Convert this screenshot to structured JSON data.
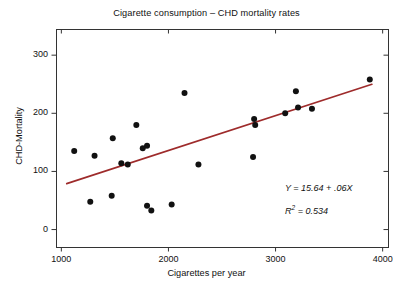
{
  "chart_data": {
    "type": "scatter",
    "title": "Cigarette consumption – CHD mortality rates",
    "xlabel": "Cigarettes per year",
    "ylabel": "CHD-Mortality",
    "xlim": [
      950,
      4050
    ],
    "ylim": [
      -30,
      345
    ],
    "xticks": [
      1000,
      2000,
      3000,
      4000
    ],
    "xtick_labels": [
      "1000",
      "2000",
      "3000",
      "4000"
    ],
    "yticks": [
      0,
      100,
      200,
      300
    ],
    "ytick_labels": [
      "0",
      "100",
      "200",
      "300"
    ],
    "grid": false,
    "legend": "none",
    "marker": {
      "shape": "circle",
      "color": "#111111",
      "size": 4.6
    },
    "points": [
      {
        "x": 1120,
        "y": 135
      },
      {
        "x": 1310,
        "y": 127
      },
      {
        "x": 1270,
        "y": 48
      },
      {
        "x": 1480,
        "y": 157
      },
      {
        "x": 1470,
        "y": 58
      },
      {
        "x": 1560,
        "y": 114
      },
      {
        "x": 1620,
        "y": 112
      },
      {
        "x": 1700,
        "y": 180
      },
      {
        "x": 1760,
        "y": 140
      },
      {
        "x": 1800,
        "y": 144
      },
      {
        "x": 1800,
        "y": 41
      },
      {
        "x": 1840,
        "y": 33
      },
      {
        "x": 2030,
        "y": 43
      },
      {
        "x": 2150,
        "y": 235
      },
      {
        "x": 2280,
        "y": 112
      },
      {
        "x": 2800,
        "y": 190
      },
      {
        "x": 2810,
        "y": 180
      },
      {
        "x": 2790,
        "y": 125
      },
      {
        "x": 3090,
        "y": 200
      },
      {
        "x": 3190,
        "y": 238
      },
      {
        "x": 3210,
        "y": 210
      },
      {
        "x": 3340,
        "y": 208
      },
      {
        "x": 3880,
        "y": 258
      }
    ],
    "regression_line": {
      "color": "#9e2b2b",
      "width": 1.6,
      "slope": 0.06,
      "intercept": 15.64,
      "x_start": 1050,
      "y_start": 79,
      "x_end": 3900,
      "y_end": 250
    },
    "annotations": [
      {
        "name": "regression-equation",
        "text_before": "Y",
        "text_mid": " = 15.64 + .06",
        "text_after": "X",
        "x_px": 285,
        "y_px": 183
      },
      {
        "name": "r-squared",
        "text_before": "R",
        "sup": "2",
        "text_after": " = 0.534",
        "x_px": 285,
        "y_px": 204
      }
    ]
  },
  "axis_frame": {
    "color": "#333333",
    "left_px": 56,
    "right_px": 388,
    "top_px": 29,
    "bottom_px": 247
  }
}
